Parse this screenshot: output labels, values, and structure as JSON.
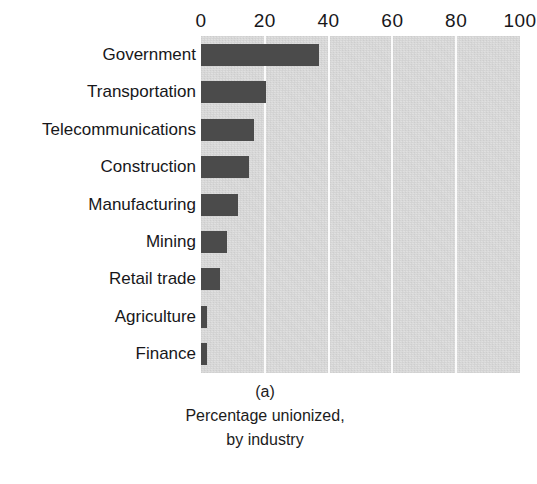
{
  "chart_data": {
    "type": "bar",
    "orientation": "horizontal",
    "title": "",
    "panel_id": "(a)",
    "caption_lines": [
      "Percentage unionized,",
      "by industry"
    ],
    "xlabel": "",
    "ylabel": "",
    "xlim": [
      0,
      100
    ],
    "ylim": null,
    "grid": true,
    "gridlines_at": [
      20,
      40,
      60,
      80
    ],
    "legend": null,
    "xticks": [
      "0",
      "20",
      "40",
      "60",
      "80",
      "100"
    ],
    "xtick_values": [
      0,
      20,
      40,
      60,
      80,
      100
    ],
    "categories": [
      "Government",
      "Transportation",
      "Telecommunications",
      "Construction",
      "Manufacturing",
      "Mining",
      "Retail trade",
      "Agriculture",
      "Finance"
    ],
    "values": [
      37,
      20.5,
      16.5,
      15,
      11.5,
      8,
      6,
      2,
      2
    ],
    "units": "percent"
  },
  "style": {
    "bar_color": "#4b4b4b",
    "panel_background": "#dedede",
    "gridline_color": "#fbfbfb",
    "page_background": "#ffffff",
    "text_color": "#17171a"
  },
  "footer": {
    "fragment": ""
  }
}
